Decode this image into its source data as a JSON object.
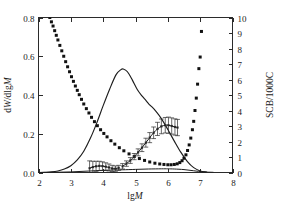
{
  "chart_data": {
    "type": "line",
    "title": "",
    "xlabel": "lgM",
    "ylabel": "dW/dlgM",
    "y2label": "SCB/1000C",
    "xlim": [
      2,
      8
    ],
    "ylim": [
      0.0,
      0.8
    ],
    "y2lim": [
      0,
      10
    ],
    "xticks": [
      "2",
      "3",
      "4",
      "5",
      "6",
      "7",
      "8"
    ],
    "xtick_values": [
      2,
      3,
      4,
      5,
      6,
      7,
      8
    ],
    "yticks": [
      "0.0",
      "0.2",
      "0.4",
      "0.6",
      "0.8"
    ],
    "ytick_values": [
      0.0,
      0.2,
      0.4,
      0.6,
      0.8
    ],
    "y2ticks": [
      "0",
      "1",
      "2",
      "3",
      "4",
      "5",
      "6",
      "7",
      "8",
      "9",
      "10"
    ],
    "y2tick_values": [
      0,
      1,
      2,
      3,
      4,
      5,
      6,
      7,
      8,
      9,
      10
    ],
    "grid": false,
    "legend": "none",
    "series": [
      {
        "name": "MWD main (dW/dlgM)",
        "axis": "left",
        "style": "solid-line",
        "x": [
          2.0,
          2.2,
          2.4,
          2.6,
          2.8,
          3.0,
          3.2,
          3.4,
          3.6,
          3.8,
          4.0,
          4.2,
          4.4,
          4.55,
          4.62,
          4.75,
          4.9,
          5.05,
          5.2,
          5.32,
          5.42,
          5.5,
          5.62,
          5.8,
          6.0,
          6.2,
          6.4,
          6.6,
          6.8,
          7.0,
          7.2
        ],
        "y": [
          0.0,
          0.001,
          0.003,
          0.008,
          0.018,
          0.035,
          0.065,
          0.11,
          0.175,
          0.255,
          0.345,
          0.43,
          0.505,
          0.531,
          0.534,
          0.52,
          0.478,
          0.43,
          0.395,
          0.372,
          0.352,
          0.34,
          0.318,
          0.278,
          0.222,
          0.162,
          0.105,
          0.058,
          0.025,
          0.008,
          0.002
        ]
      },
      {
        "name": "MWD low baseline",
        "axis": "left",
        "style": "solid-line-thin",
        "x": [
          2.0,
          2.5,
          3.0,
          3.5,
          4.0,
          4.3,
          4.6,
          5.0,
          5.4,
          5.8,
          6.0,
          6.2,
          6.5,
          6.8,
          7.1,
          7.4
        ],
        "y": [
          0.0,
          0.001,
          0.003,
          0.007,
          0.011,
          0.013,
          0.014,
          0.016,
          0.018,
          0.019,
          0.019,
          0.018,
          0.015,
          0.009,
          0.003,
          0.001
        ]
      },
      {
        "name": "SCB/1000C",
        "axis": "right",
        "style": "filled-square-markers",
        "x": [
          2.35,
          2.4,
          2.45,
          2.5,
          2.55,
          2.6,
          2.66,
          2.72,
          2.78,
          2.84,
          2.9,
          2.96,
          3.02,
          3.08,
          3.14,
          3.2,
          3.26,
          3.33,
          3.4,
          3.48,
          3.56,
          3.64,
          3.73,
          3.82,
          3.92,
          4.02,
          4.12,
          4.24,
          4.36,
          4.5,
          4.64,
          4.8,
          4.96,
          5.12,
          5.28,
          5.44,
          5.6,
          5.75,
          5.88,
          6.0,
          6.1,
          6.2,
          6.29,
          6.37,
          6.44,
          6.5,
          6.56,
          6.61,
          6.66,
          6.71,
          6.76,
          6.8,
          6.84,
          6.88,
          6.92,
          6.96,
          7.0,
          7.04
        ],
        "y": [
          10.0,
          9.72,
          9.45,
          9.15,
          8.85,
          8.55,
          8.2,
          7.85,
          7.5,
          7.15,
          6.82,
          6.5,
          6.18,
          5.88,
          5.58,
          5.3,
          5.02,
          4.72,
          4.42,
          4.12,
          3.84,
          3.56,
          3.28,
          3.02,
          2.76,
          2.52,
          2.3,
          2.05,
          1.83,
          1.6,
          1.4,
          1.2,
          1.03,
          0.9,
          0.78,
          0.68,
          0.6,
          0.55,
          0.52,
          0.5,
          0.5,
          0.52,
          0.56,
          0.64,
          0.76,
          0.92,
          1.14,
          1.42,
          1.78,
          2.22,
          2.76,
          3.3,
          4.0,
          4.8,
          5.7,
          6.7,
          7.45,
          9.1
        ]
      },
      {
        "name": "SCB measured with error bars (low-M shoulder)",
        "axis": "left",
        "style": "points-with-errorbars",
        "x": [
          3.58,
          3.68,
          3.78,
          3.88,
          3.98,
          4.08,
          4.18,
          4.28,
          4.38,
          4.48
        ],
        "y": [
          0.022,
          0.028,
          0.032,
          0.034,
          0.033,
          0.03,
          0.026,
          0.021,
          0.02,
          0.024
        ],
        "yerr": [
          0.038,
          0.03,
          0.026,
          0.024,
          0.022,
          0.02,
          0.018,
          0.016,
          0.014,
          0.013
        ]
      },
      {
        "name": "SCB measured with error bars (rising branch)",
        "axis": "left",
        "style": "points-with-errorbars",
        "x": [
          4.6,
          4.72,
          4.84,
          4.96,
          5.08,
          5.2,
          5.32,
          5.44,
          5.56,
          5.68,
          5.8,
          5.92,
          6.02,
          6.12,
          6.22,
          6.3
        ],
        "y": [
          0.032,
          0.046,
          0.062,
          0.082,
          0.104,
          0.128,
          0.154,
          0.18,
          0.205,
          0.225,
          0.238,
          0.244,
          0.244,
          0.24,
          0.235,
          0.232
        ],
        "yerr": [
          0.014,
          0.014,
          0.015,
          0.016,
          0.018,
          0.02,
          0.023,
          0.026,
          0.03,
          0.034,
          0.038,
          0.04,
          0.042,
          0.042,
          0.042,
          0.042
        ]
      }
    ]
  }
}
